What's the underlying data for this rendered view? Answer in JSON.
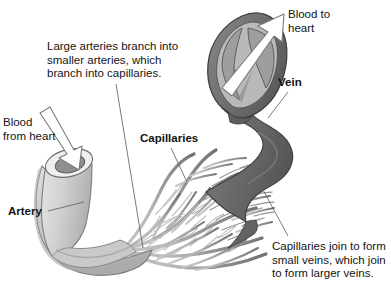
{
  "figure": {
    "type": "anatomical-illustration",
    "width": 391,
    "height": 285,
    "background": "#ffffff"
  },
  "labels": {
    "blood_from_heart": "Blood\nfrom heart",
    "large_arteries": "Large arteries branch into\nsmaller arteries, which\nbranch into capillaries.",
    "artery": "Artery",
    "capillaries": "Capillaries",
    "blood_to_heart": "Blood to\nheart",
    "vein": "Vein",
    "capillaries_join": "Capillaries join to form\nsmall veins, which join\nto form larger veins."
  },
  "structures": {
    "artery_name": "artery-vessel",
    "artery_opening_name": "artery-cut-opening",
    "vein_name": "vein-vessel",
    "vein_valve_name": "vein-valve-cutaway",
    "capillary_bed_name": "capillary-network",
    "inflow_arrow_name": "blood-inflow-arrow",
    "outflow_arrow_name": "blood-outflow-arrow"
  },
  "colors": {
    "artery_light": "#d5d5d5",
    "artery_mid": "#c2c2c2",
    "artery_shadow": "#a9a9a9",
    "artery_lumen": "#8e8e8e",
    "vein_dark": "#6e6e6e",
    "vein_darker": "#5d5d5d",
    "vein_lumen_light": "#b5b5b5",
    "capillary_light": "#c9c9c9",
    "capillary_dark": "#777777",
    "outline": "#4a4a4a",
    "arrow_fill": "#ffffff",
    "text": "#141414",
    "leader_line": "#6b6b6b"
  },
  "leader_lines": {
    "blood_from_heart": "from text at left down-right into artery opening",
    "large_arteries": "from text block down to capillary junction at lower left",
    "artery": "from bold Artery label up-right to artery wall",
    "capillaries": "from bold Capillaries label down-right into capillary mesh",
    "vein": "from bold Vein label down-left to vein wall",
    "capillaries_join": "from bottom-right text up-left to venous capillary convergence"
  }
}
